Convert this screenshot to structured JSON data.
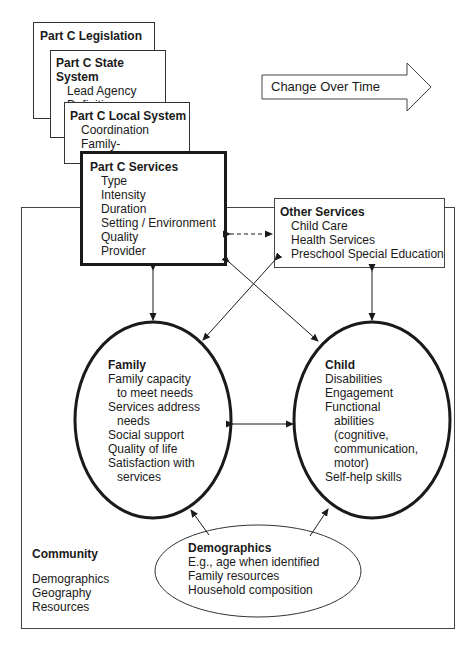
{
  "legislation": {
    "title": "Part C Legislation"
  },
  "state_system": {
    "title": "Part C State System",
    "items": [
      "Lead Agency",
      "Definition"
    ]
  },
  "local_system": {
    "title": "Part C Local System",
    "items": [
      "Coordination",
      "Family-centeredness"
    ]
  },
  "change_arrow": {
    "label": "Change Over Time"
  },
  "part_c_services": {
    "title": "Part C Services",
    "items": [
      "Type",
      "Intensity",
      "Duration",
      "Setting / Environment",
      "Quality",
      "Provider"
    ]
  },
  "other_services": {
    "title": "Other Services",
    "items": [
      "Child Care",
      "Health Services",
      "Preschool Special Education"
    ]
  },
  "family": {
    "title": "Family",
    "items": [
      "Family capacity",
      "to meet needs",
      "Services address",
      "needs",
      "Social support",
      "Quality of life",
      "Satisfaction with",
      "services"
    ]
  },
  "child": {
    "title": "Child",
    "items": [
      "Disabilities",
      "Engagement",
      "Functional",
      "abilities",
      "(cognitive,",
      "communication,",
      "motor)",
      "Self-help skills"
    ]
  },
  "community": {
    "title": "Community",
    "items": [
      "Demographics",
      "Geography",
      "Resources"
    ]
  },
  "demographics": {
    "title": "Demographics",
    "items": [
      "E.g., age when identified",
      "Family resources",
      "Household composition"
    ]
  }
}
